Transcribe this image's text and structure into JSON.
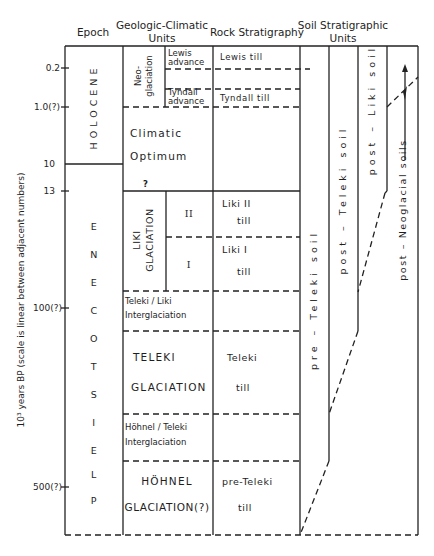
{
  "headers": {
    "epoch": "Epoch",
    "geologic_climatic_line1": "Geologic-Climatic",
    "geologic_climatic_line2": "Units",
    "rock_stratigraphy": "Rock Stratigraphy",
    "soil_line1": "Soil Stratigraphic",
    "soil_line2": "Units"
  },
  "y_axis": {
    "label": "10³ years BP (scale is linear between adjacent numbers)",
    "ticks": [
      "0.2",
      "1.0(?)",
      "10",
      "13",
      "100(?)",
      "500(?)"
    ]
  },
  "epochs": {
    "holocene": "HOLOCENE",
    "pleistocene": "PLEISTOCENE"
  },
  "geologic_climatic_units": {
    "neoglaciation": "Neo- glaciation",
    "neo_line1": "Neo-",
    "neo_line2": "glaciation",
    "lewis_advance_1": "Lewis",
    "lewis_advance_2": "advance",
    "tyndall_advance_1": "Tyndall",
    "tyndall_advance_2": "advance",
    "climatic_optimum_1": "Climatic",
    "climatic_optimum_2": "Optimum",
    "question_mark": "?",
    "liki_glaciation_1": "LIKI",
    "liki_glaciation_2": "GLACIATION",
    "liki_ii": "II",
    "liki_i": "I",
    "teleki_liki_1": "Teleki / Liki",
    "teleki_liki_2": "Interglaciation",
    "teleki_glaciation_1": "TELEKI",
    "teleki_glaciation_2": "GLACIATION",
    "hohnel_teleki_1": "Höhnel / Teleki",
    "hohnel_teleki_2": "Interglaciation",
    "hohnel_glaciation_1": "HÖHNEL",
    "hohnel_glaciation_2": "GLACIATION(?)"
  },
  "rock_stratigraphy": {
    "lewis_till": "Lewis  till",
    "tyndall_till": "Tyndall  till",
    "liki_ii_till_1": "Liki  II",
    "liki_ii_till_2": "till",
    "liki_i_till_1": "Liki  I",
    "liki_i_till_2": "till",
    "teleki_till_1": "Teleki",
    "teleki_till_2": "till",
    "pre_teleki_till_1": "pre-Teleki",
    "pre_teleki_till_2": "till"
  },
  "soil_units": {
    "pre_teleki_soil": "pre – Teleki  soil",
    "post_teleki_soil": "post – Teleki  soil",
    "post_liki_soil": "post – Liki  soil",
    "post_neoglacial_soils": "post – Neoglacial  soils"
  }
}
